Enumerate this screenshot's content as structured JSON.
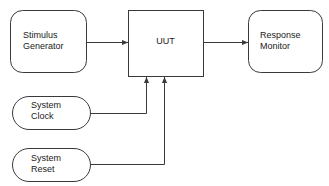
{
  "diagram": {
    "type": "block-diagram",
    "stroke_color": "#3a3a3a",
    "text_color": "#1a1a1a",
    "background_color": "#ffffff",
    "nodes": [
      {
        "id": "stimulus-generator",
        "label": "Stimulus\nGenerator",
        "shape": "rounded-rectangle",
        "x": 10,
        "y": 10,
        "width": 76,
        "height": 62,
        "radius": 12
      },
      {
        "id": "uut",
        "label": "UUT",
        "shape": "rectangle",
        "x": 128,
        "y": 10,
        "width": 75,
        "height": 66,
        "radius": 0
      },
      {
        "id": "response-monitor",
        "label": "Response\nMonitor",
        "shape": "rounded-rectangle",
        "x": 248,
        "y": 10,
        "width": 74,
        "height": 62,
        "radius": 12
      },
      {
        "id": "system-clock",
        "label": "System\nClock",
        "shape": "stadium",
        "x": 12,
        "y": 96,
        "width": 78,
        "height": 33,
        "radius": 16
      },
      {
        "id": "system-reset",
        "label": "System\nReset",
        "shape": "stadium",
        "x": 12,
        "y": 148,
        "width": 78,
        "height": 33,
        "radius": 16
      }
    ],
    "connectors": [
      {
        "id": "stimulus-to-uut",
        "from": "stimulus-generator",
        "to": "uut",
        "arrow": true,
        "points": "86,42 128,42"
      },
      {
        "id": "uut-to-response",
        "from": "uut",
        "to": "response-monitor",
        "arrow": true,
        "points": "203,42 248,42"
      },
      {
        "id": "clock-to-uut",
        "from": "system-clock",
        "to": "uut",
        "arrow": true,
        "points": "90,113 146,113 146,76"
      },
      {
        "id": "reset-to-uut",
        "from": "system-reset",
        "to": "uut",
        "arrow": true,
        "points": "90,164 164,164 164,76"
      }
    ]
  }
}
